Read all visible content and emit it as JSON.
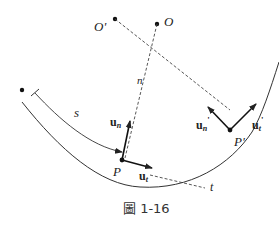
{
  "figure": {
    "caption": "圖 1-16",
    "points": {
      "O": "O",
      "O_prime": "O'",
      "P": "P",
      "P_prime": "P'"
    },
    "labels": {
      "arc_length": "s",
      "normal_line": "n",
      "tangent_line": "t",
      "u_n": "u",
      "u_n_sub": "n",
      "u_t": "u",
      "u_t_sub": "t",
      "u_n_prime": "u",
      "u_n_prime_sub": "n",
      "u_n_prime_mark": "'",
      "u_t_prime": "u",
      "u_t_prime_sub": "t",
      "u_t_prime_mark": "'"
    },
    "colors": {
      "line": "#222222",
      "dashed": "#444444",
      "curve": "#333333"
    }
  }
}
